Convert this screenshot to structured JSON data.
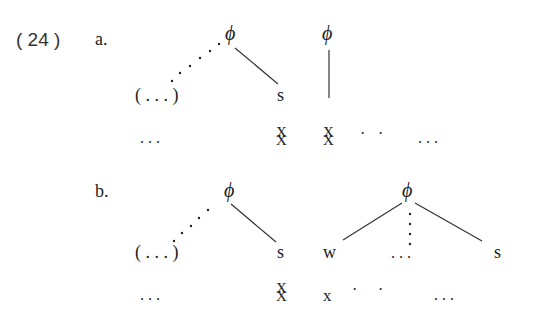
{
  "example": {
    "number": "( 24 )",
    "subexamples": [
      {
        "label": "a.",
        "nodes": {
          "phi_left": "ϕ",
          "phi_right": "ϕ",
          "optional_left": "( . . . )",
          "s": "s"
        },
        "skeleton": {
          "left_ellipsis": ". . .",
          "x_stack_1": [
            "X",
            "X"
          ],
          "x_stack_2": [
            "X",
            "X"
          ],
          "dots": [
            "·",
            "·"
          ],
          "right_ellipsis": ". . ."
        }
      },
      {
        "label": "b.",
        "nodes": {
          "phi_left": "ϕ",
          "phi_right": "ϕ",
          "optional_left": "( . . . )",
          "s_left": "s",
          "w": "w",
          "middle_ellipsis": ". . .",
          "s_right": "s"
        },
        "skeleton": {
          "left_ellipsis": ". . .",
          "x_stack_1": [
            "X",
            "X"
          ],
          "x_single": "x",
          "dots": [
            "·",
            "·"
          ],
          "right_ellipsis": ". . ."
        }
      }
    ]
  }
}
